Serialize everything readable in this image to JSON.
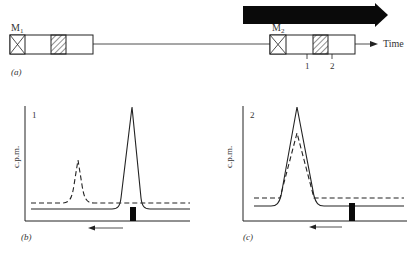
{
  "panel_a": {
    "label": "(a)",
    "marker1": "M",
    "marker1_sub": "1",
    "marker2": "M",
    "marker2_sub": "2",
    "time_label": "Time",
    "tick1": "1",
    "tick2": "2"
  },
  "panel_b": {
    "label": "(b)",
    "number": "1",
    "ylabel": "c.p.m."
  },
  "panel_c": {
    "label": "(c)",
    "number": "2",
    "ylabel": "c.p.m."
  },
  "colors": {
    "ink": "#111111",
    "text": "#333333"
  }
}
